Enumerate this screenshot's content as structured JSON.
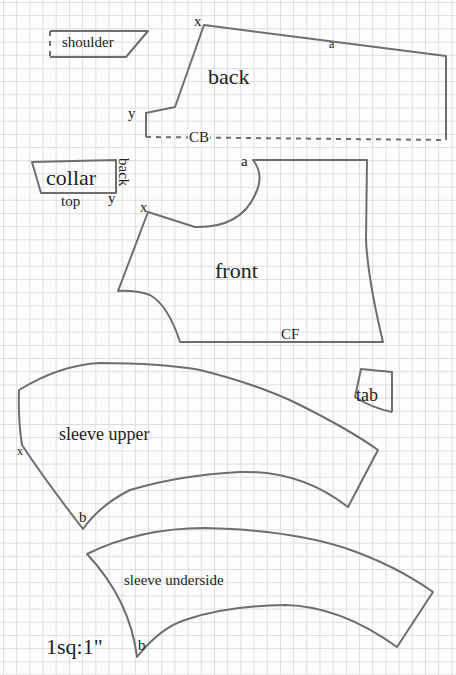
{
  "scale_note": "1sq:1\"",
  "colors": {
    "line": "#6e6e6e",
    "grid": "#dcdcdc",
    "text": "#222222"
  },
  "pieces": {
    "shoulder": {
      "label": "shoulder"
    },
    "back": {
      "label": "back",
      "marks": {
        "x": "x",
        "y": "y",
        "a": "a",
        "cb": "CB"
      }
    },
    "collar": {
      "label": "collar",
      "side_back": "back",
      "side_top": "top",
      "mark_y": "y"
    },
    "front": {
      "label": "front",
      "marks": {
        "x": "x",
        "a": "a",
        "cf": "CF"
      }
    },
    "tab": {
      "label": "tab"
    },
    "sleeve_upper": {
      "label": "sleeve upper",
      "marks": {
        "x": "x",
        "b": "b"
      }
    },
    "sleeve_underside": {
      "label": "sleeve underside",
      "marks": {
        "b": "b"
      }
    }
  }
}
